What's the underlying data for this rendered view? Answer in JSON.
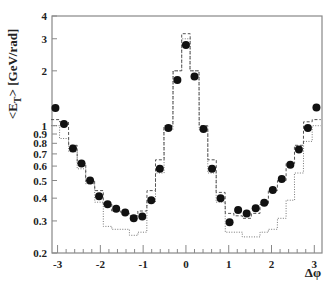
{
  "chart_data": {
    "type": "scatter",
    "title": "",
    "xlabel": "Δφ",
    "ylabel": "<E_T> [GeV/rad]",
    "xlim": [
      -3.13,
      3.18
    ],
    "ylim": [
      0.2,
      4
    ],
    "yscale": "log",
    "grid": false,
    "legend": null,
    "x_ticks": [
      -3,
      -2,
      -1,
      0,
      1,
      2,
      3
    ],
    "x_tick_labels": [
      "-3",
      "-2",
      "-1",
      "0",
      "1",
      "2",
      "3"
    ],
    "y_ticks": [
      0.2,
      0.3,
      0.4,
      0.5,
      0.6,
      0.7,
      0.8,
      0.9,
      1,
      2,
      3,
      4
    ],
    "y_tick_labels": [
      "0.2",
      "0.3",
      "0.4",
      "0.5",
      "0.6",
      "0.7",
      "0.8",
      "0.9",
      "1",
      "2",
      "3",
      "4"
    ],
    "series": [
      {
        "name": "data",
        "style": "filled-circle",
        "x": [
          -3.05,
          -2.85,
          -2.64,
          -2.44,
          -2.24,
          -2.03,
          -1.83,
          -1.63,
          -1.42,
          -1.22,
          -1.02,
          -0.81,
          -0.61,
          -0.41,
          -0.2,
          0.0,
          0.2,
          0.41,
          0.61,
          0.81,
          1.02,
          1.22,
          1.42,
          1.63,
          1.83,
          2.03,
          2.24,
          2.44,
          2.64,
          2.85,
          3.05
        ],
        "values": [
          1.25,
          1.02,
          0.75,
          0.62,
          0.5,
          0.41,
          0.37,
          0.35,
          0.334,
          0.31,
          0.317,
          0.39,
          0.58,
          0.97,
          1.78,
          2.77,
          1.86,
          0.96,
          0.58,
          0.4,
          0.295,
          0.344,
          0.33,
          0.352,
          0.378,
          0.443,
          0.51,
          0.61,
          0.74,
          0.97,
          1.26
        ]
      },
      {
        "name": "model-dashed",
        "style": "dashed-step",
        "x": [
          -3.05,
          -2.85,
          -2.64,
          -2.44,
          -2.24,
          -2.03,
          -1.83,
          -1.63,
          -1.42,
          -1.22,
          -1.02,
          -0.81,
          -0.61,
          -0.41,
          -0.2,
          0.0,
          0.2,
          0.41,
          0.61,
          0.81,
          1.02,
          1.22,
          1.42,
          1.63,
          1.83,
          2.03,
          2.24,
          2.44,
          2.64,
          2.85,
          3.05
        ],
        "values": [
          1.08,
          1.05,
          0.78,
          0.62,
          0.5,
          0.44,
          0.37,
          0.34,
          0.33,
          0.32,
          0.34,
          0.44,
          0.65,
          1.0,
          2.0,
          3.2,
          2.0,
          1.0,
          0.65,
          0.43,
          0.33,
          0.32,
          0.31,
          0.33,
          0.37,
          0.44,
          0.5,
          0.62,
          0.78,
          1.05,
          1.08
        ]
      },
      {
        "name": "model-dotted",
        "style": "dotted-step",
        "x": [
          -3.05,
          -2.85,
          -2.64,
          -2.44,
          -2.24,
          -2.03,
          -1.83,
          -1.63,
          -1.42,
          -1.22,
          -1.02,
          -0.81,
          -0.61,
          -0.41,
          -0.2,
          0.0,
          0.2,
          0.41,
          0.61,
          0.81,
          1.02,
          1.22,
          1.42,
          1.63,
          1.83,
          2.03,
          2.24,
          2.44,
          2.64,
          2.85,
          3.05
        ],
        "values": [
          1.0,
          0.85,
          0.72,
          0.58,
          0.48,
          0.38,
          0.28,
          0.27,
          0.27,
          0.25,
          0.26,
          0.38,
          0.55,
          0.95,
          2.0,
          3.0,
          2.0,
          0.95,
          0.55,
          0.38,
          0.26,
          0.26,
          0.245,
          0.245,
          0.26,
          0.27,
          0.31,
          0.39,
          0.55,
          0.82,
          1.0
        ]
      }
    ]
  }
}
